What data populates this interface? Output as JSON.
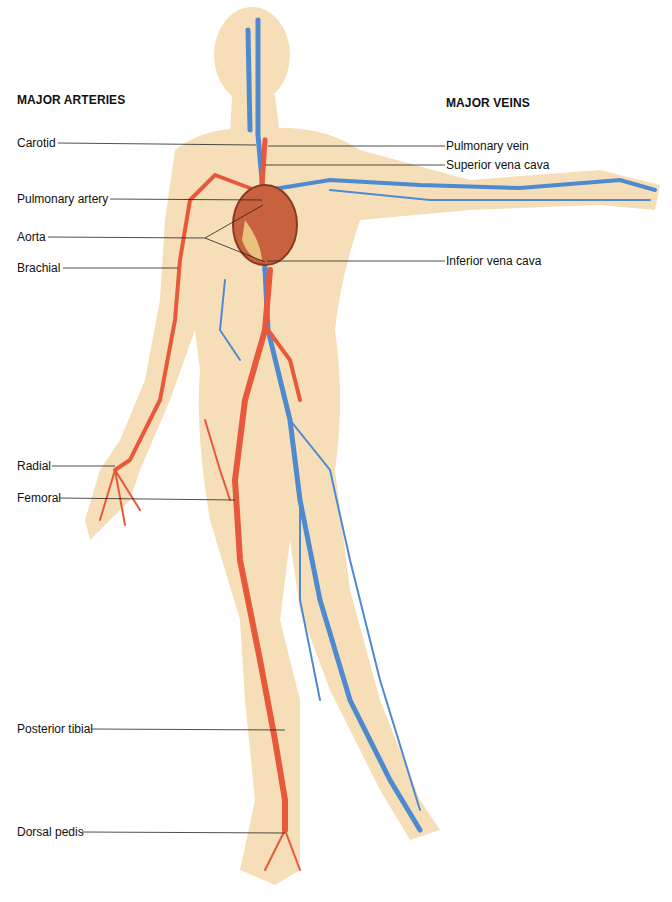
{
  "headings": {
    "arteries": "MAJOR ARTERIES",
    "veins": "MAJOR VEINS"
  },
  "arteries": [
    {
      "label": "Carotid"
    },
    {
      "label": "Pulmonary artery"
    },
    {
      "label": "Aorta"
    },
    {
      "label": "Brachial"
    },
    {
      "label": "Radial"
    },
    {
      "label": "Femoral"
    },
    {
      "label": "Posterior tibial"
    },
    {
      "label": "Dorsal pedis"
    }
  ],
  "veins": [
    {
      "label": "Pulmonary vein"
    },
    {
      "label": "Superior vena cava"
    },
    {
      "label": "Inferior vena cava"
    }
  ],
  "colors": {
    "skin": "#f6dfb8",
    "artery": "#e8583a",
    "vein": "#4f8ad0",
    "heart": "#c8623e",
    "leader": "#222222"
  }
}
